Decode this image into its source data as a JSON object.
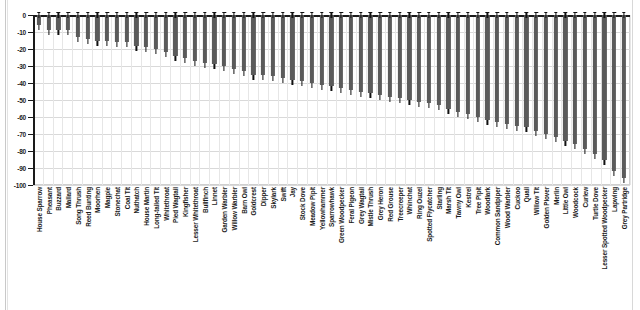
{
  "chart_data": {
    "type": "bar",
    "title": "",
    "subtitle": "",
    "xlabel": "",
    "ylabel": "",
    "ylim": [
      -100,
      0
    ],
    "yticks": [
      0,
      -10,
      -20,
      -30,
      -40,
      -50,
      -60,
      -70,
      -80,
      -90,
      -100
    ],
    "ytick_labels": [
      "0",
      "-10",
      "-20",
      "-30",
      "-40",
      "-50",
      "-60",
      "-70",
      "-80",
      "-90",
      "-100"
    ],
    "grid": true,
    "legend": "none",
    "orientation": "vertical",
    "bar_color": "#5a5a5a",
    "axis_color": "#1a1a1a",
    "grid_color": "#d9d9d9",
    "error_bars": true,
    "categories": [
      "House Sparrow",
      "Pheasant",
      "Buzzard",
      "Mallard",
      "Song Thrush",
      "Reed Bunting",
      "Moorhen",
      "Magpie",
      "Stonechat",
      "Coal Tit",
      "Nuthatch",
      "House Martin",
      "Long-tailed Tit",
      "Whitethroat",
      "Pied Wagtail",
      "Kingfisher",
      "Lesser Whitethroat",
      "Bullfinch",
      "Linnet",
      "Garden Warbler",
      "Willow Warbler",
      "Barn Owl",
      "Goldcrest",
      "Dipper",
      "Skylark",
      "Swift",
      "Jay",
      "Stock Dove",
      "Meadow Pipit",
      "Yellowhammer",
      "Sparrowhawk",
      "Green Woodpecker",
      "Feral Pigeon",
      "Grey Wagtail",
      "Mistle Thrush",
      "Grey Heron",
      "Red Grouse",
      "Treecreeper",
      "Whinchat",
      "Ring Ouzel",
      "Spotted Flycatcher",
      "Starling",
      "Marsh Tit",
      "Tawny Owl",
      "Kestrel",
      "Tree Pipit",
      "Woodlark",
      "Common Sandpiper",
      "Wood Warbler",
      "Cuckoo",
      "Quail",
      "Willow Tit",
      "Golden Plover",
      "Merlin",
      "Little Owl",
      "Woodcock",
      "Curlew",
      "Turtle Dove",
      "Lesser Spotted Woodpecker",
      "Lapwing",
      "Grey Partridge"
    ],
    "values": [
      -6,
      -9,
      -9,
      -9,
      -13,
      -14,
      -15,
      -15,
      -16,
      -16,
      -18,
      -19,
      -20,
      -22,
      -24,
      -25,
      -27,
      -28,
      -29,
      -30,
      -32,
      -33,
      -35,
      -35,
      -36,
      -37,
      -38,
      -39,
      -40,
      -41,
      -42,
      -43,
      -44,
      -45,
      -46,
      -47,
      -48,
      -49,
      -50,
      -51,
      -52,
      -53,
      -55,
      -57,
      -58,
      -60,
      -62,
      -63,
      -64,
      -65,
      -66,
      -68,
      -70,
      -72,
      -74,
      -76,
      -79,
      -82,
      -85,
      -92,
      -96
    ],
    "error_low": [
      -9,
      -12,
      -12,
      -12,
      -16,
      -17,
      -18,
      -18,
      -19,
      -19,
      -21,
      -22,
      -23,
      -25,
      -27,
      -28,
      -30,
      -31,
      -32,
      -33,
      -35,
      -36,
      -38,
      -38,
      -39,
      -40,
      -41,
      -42,
      -43,
      -44,
      -45,
      -46,
      -47,
      -48,
      -49,
      -50,
      -51,
      -52,
      -53,
      -54,
      -55,
      -56,
      -58,
      -60,
      -61,
      -63,
      -65,
      -66,
      -67,
      -68,
      -69,
      -71,
      -73,
      -75,
      -77,
      -79,
      -82,
      -85,
      -88,
      -95,
      -99
    ]
  }
}
